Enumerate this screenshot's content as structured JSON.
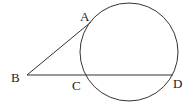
{
  "diagram": {
    "labels": {
      "A": "A",
      "B": "B",
      "C": "C",
      "D": "D"
    },
    "stroke_color": "#333333"
  }
}
